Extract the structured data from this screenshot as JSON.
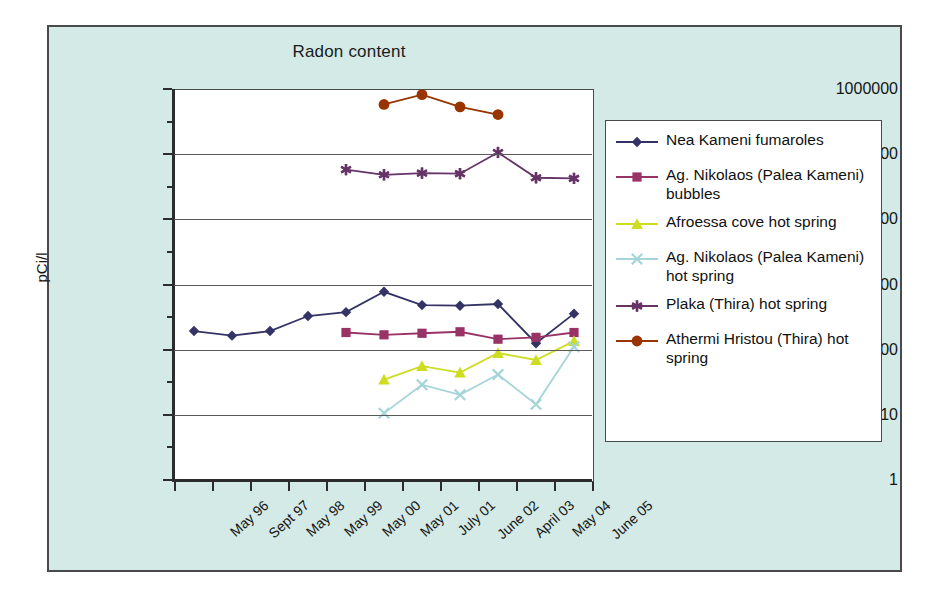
{
  "chart_data": {
    "type": "line",
    "title": "Radon content",
    "xlabel": "",
    "ylabel": "pCi/l",
    "yscale": "log",
    "ylim": [
      1,
      1000000
    ],
    "ytick_labels": [
      "1000000",
      "100000",
      "10000",
      "1000",
      "100",
      "10",
      "1"
    ],
    "ytick_values": [
      1000000,
      100000,
      10000,
      1000,
      100,
      10,
      1
    ],
    "grid": true,
    "legend_position": "right",
    "categories": [
      "May 96",
      "Sept 97",
      "May 98",
      "May 99",
      "May 00",
      "May 01",
      "July 01",
      "June 02",
      "April 03",
      "May 04",
      "June 05"
    ],
    "series": [
      {
        "name": "Nea Kameni fumaroles",
        "color": "#333366",
        "marker": "diamond",
        "values": [
          200,
          170,
          200,
          340,
          390,
          800,
          500,
          490,
          520,
          130,
          370
        ]
      },
      {
        "name": "Ag. Nikolaos (Palea Kameni) bubbles",
        "color": "#993366",
        "marker": "square",
        "values": [
          null,
          null,
          null,
          null,
          190,
          175,
          185,
          195,
          150,
          160,
          190
        ]
      },
      {
        "name": "Afroessa cove hot spring",
        "color": "#ccdd22",
        "marker": "triangle",
        "values": [
          null,
          null,
          null,
          null,
          null,
          36,
          58,
          46,
          92,
          72,
          140
        ]
      },
      {
        "name": "Ag. Nikolaos (Palea Kameni) hot spring",
        "color": "#a5d5d8",
        "marker": "x",
        "values": [
          null,
          null,
          null,
          null,
          null,
          11,
          30,
          21,
          43,
          15,
          115
        ]
      },
      {
        "name": "Plaka (Thira) hot spring",
        "color": "#663366",
        "marker": "star",
        "values": [
          null,
          null,
          null,
          null,
          60000,
          50000,
          53000,
          52000,
          110000,
          45000,
          44000
        ]
      },
      {
        "name": "Athermi Hristou (Thira) hot spring",
        "color": "#993300",
        "marker": "circle",
        "values": [
          null,
          null,
          null,
          null,
          null,
          600000,
          850000,
          550000,
          420000,
          null,
          null
        ]
      }
    ]
  },
  "legend": {
    "items": [
      {
        "label": "Nea Kameni fumaroles",
        "color": "#333366",
        "marker": "diamond"
      },
      {
        "label": "Ag. Nikolaos (Palea Kameni) bubbles",
        "color": "#993366",
        "marker": "square"
      },
      {
        "label": "Afroessa cove hot spring",
        "color": "#ccdd22",
        "marker": "triangle"
      },
      {
        "label": "Ag. Nikolaos (Palea Kameni) hot spring",
        "color": "#a5d5d8",
        "marker": "x"
      },
      {
        "label": "Plaka (Thira) hot spring",
        "color": "#663366",
        "marker": "star"
      },
      {
        "label": "Athermi Hristou (Thira) hot spring",
        "color": "#993300",
        "marker": "circle"
      }
    ]
  },
  "colors": {
    "card_background": "#d3eae6",
    "plot_background": "#ffffff",
    "frame": "#4a4a4a",
    "gridline": "#5a5a5a",
    "text": "#151515"
  }
}
